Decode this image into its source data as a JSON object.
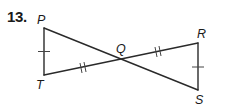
{
  "problem": {
    "number": "13."
  },
  "figure": {
    "labels": {
      "P": "P",
      "Q": "Q",
      "R": "R",
      "S": "S",
      "T": "T"
    },
    "points": {
      "P": [
        44,
        28
      ],
      "T": [
        44,
        75
      ],
      "Q": [
        122,
        59
      ],
      "R": [
        198,
        43
      ],
      "S": [
        198,
        90
      ]
    },
    "congruence_marks": {
      "single_tick": [
        "PT",
        "RS"
      ],
      "double_tick": [
        "TQ",
        "QR"
      ]
    },
    "stroke_color": "#2a2a2a"
  }
}
